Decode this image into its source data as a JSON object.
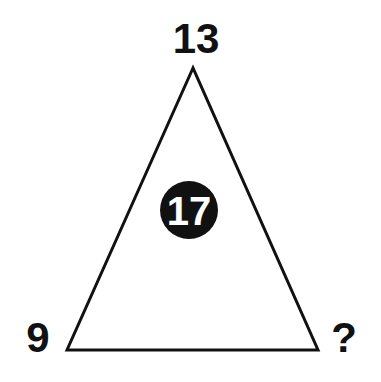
{
  "puzzle": {
    "top_value": "13",
    "center_value": "17",
    "left_value": "9",
    "right_value": "?"
  },
  "colors": {
    "background": "#ffffff",
    "stroke": "#111111",
    "circle_fill": "#111111",
    "center_text": "#ffffff"
  }
}
